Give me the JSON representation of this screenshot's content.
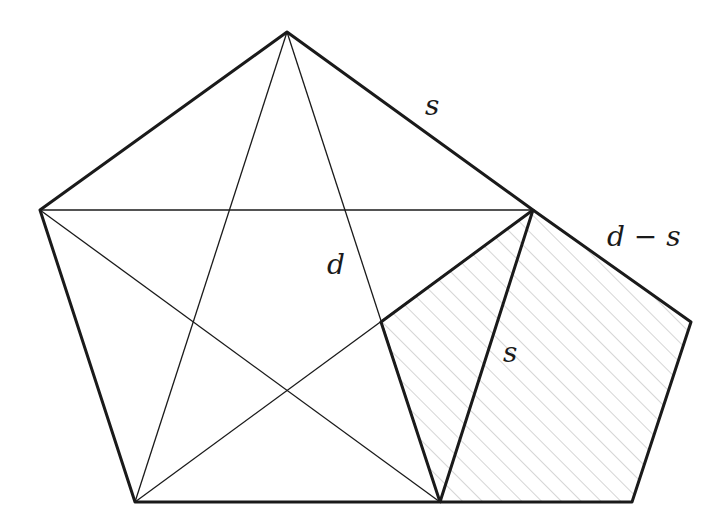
{
  "diagram": {
    "labels": {
      "top_side": "s",
      "diagonal": "d",
      "inner_side": "s",
      "small_pentagon_side": "d − s"
    },
    "colors": {
      "stroke": "#1a1a1a",
      "hatch": "#b0b0b0",
      "background": "#ffffff"
    },
    "vertices": {
      "top": [
        287,
        32
      ],
      "left": [
        40,
        210
      ],
      "right": [
        533,
        210
      ],
      "bottom_left": [
        135,
        502
      ],
      "bottom_right": [
        440,
        502
      ],
      "inner": [
        381,
        322
      ],
      "small_right": [
        691,
        322
      ],
      "small_bottom": [
        632,
        502
      ]
    }
  }
}
